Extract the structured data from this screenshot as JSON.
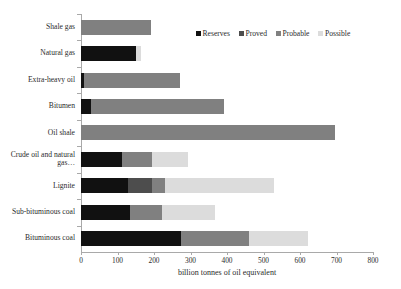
{
  "chart_data": {
    "type": "bar",
    "orientation": "horizontal",
    "stacked": true,
    "title": "",
    "xlabel": "billion tonnes of oil equivalent",
    "ylabel": "",
    "xlim": [
      0,
      800
    ],
    "xticks": [
      0,
      100,
      200,
      300,
      400,
      500,
      600,
      700,
      800
    ],
    "xtick_labels": [
      "0",
      "100",
      "200",
      "300",
      "400",
      "500",
      "600",
      "700",
      "800"
    ],
    "grid": false,
    "legend_position": "top-right",
    "categories": [
      "Shale gas",
      "Natural gas",
      "Extra-heavy oil",
      "Bitumen",
      "Oil shale",
      "Crude oil and natural gas…",
      "Lignite",
      "Sub-bituminous coal",
      "Bituminous coal"
    ],
    "series": [
      {
        "name": "Reserves",
        "color": "#111111",
        "values": [
          0,
          150,
          8,
          28,
          0,
          112,
          129,
          134,
          274
        ]
      },
      {
        "name": "Proved",
        "color": "#4d4d4d",
        "values": [
          0,
          0,
          0,
          0,
          0,
          0,
          66,
          0,
          0
        ]
      },
      {
        "name": "Probable",
        "color": "#808080",
        "values": [
          193,
          0,
          262,
          364,
          696,
          82,
          36,
          88,
          186
        ]
      },
      {
        "name": "Possible",
        "color": "#dcdcdc",
        "values": [
          0,
          15,
          0,
          0,
          0,
          99,
          297,
          145,
          162
        ]
      }
    ],
    "totals": [
      193,
      165,
      270,
      392,
      696,
      293,
      528,
      367,
      622
    ]
  },
  "legend": {
    "items": [
      {
        "label": "Reserves"
      },
      {
        "label": "Proved"
      },
      {
        "label": "Probable"
      },
      {
        "label": "Possible"
      }
    ]
  },
  "colors": {
    "reserves": "#111111",
    "proved": "#4d4d4d",
    "probable": "#808080",
    "possible": "#dcdcdc",
    "axis": "#a9a9a9",
    "text": "#2b2b2b",
    "background": "#ffffff"
  }
}
